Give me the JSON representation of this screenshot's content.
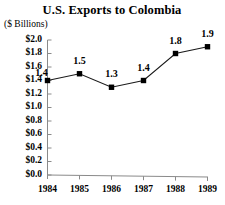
{
  "chart_data": {
    "type": "line",
    "title": "U.S. Exports to Colombia",
    "ylabel": "($ Billions)",
    "xlabel": "",
    "categories": [
      "1984",
      "1985",
      "1986",
      "1987",
      "1988",
      "1989"
    ],
    "values": [
      1.4,
      1.5,
      1.3,
      1.4,
      1.8,
      1.9
    ],
    "point_labels": [
      "1.4",
      "1.5",
      "1.3",
      "1.4",
      "1.8",
      "1.9"
    ],
    "ylim": [
      0.0,
      2.0
    ],
    "ytick_labels": [
      "$2.0",
      "$1.8",
      "$1.6",
      "$1.4",
      "$1.2",
      "$1.0",
      "$0.8",
      "$0.6",
      "$0.4",
      "$0.2",
      "$0.0"
    ],
    "ytick_values": [
      2.0,
      1.8,
      1.6,
      1.4,
      1.2,
      1.0,
      0.8,
      0.6,
      0.4,
      0.2,
      0.0
    ],
    "grid": false,
    "legend": null,
    "marker": "square",
    "colors": {
      "line": "#000000",
      "marker": "#000000",
      "axis": "#808080",
      "text": "#000000",
      "background": "#ffffff"
    }
  }
}
